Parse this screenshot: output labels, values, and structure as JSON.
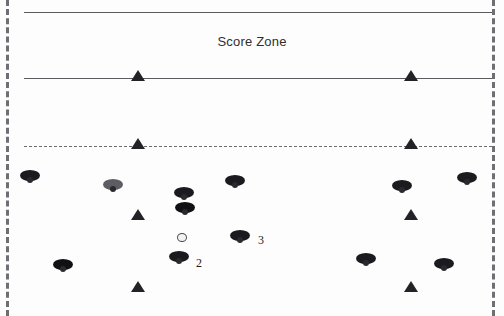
{
  "canvas": {
    "width": 504,
    "height": 316,
    "background": "#fdfdfd"
  },
  "colors": {
    "line": "#5a5a5f",
    "sideline": "#6f6f73",
    "cone": "#232327",
    "player_dark": "#1b1b1f",
    "player_light": "#5d5d63",
    "text": "#2e2e32"
  },
  "field": {
    "zone_label": "Score Zone",
    "sidelines": [
      {
        "name": "left-sideline",
        "x": 6,
        "style": "dashed"
      },
      {
        "name": "right-sideline",
        "x": 492,
        "style": "dashed"
      }
    ],
    "lines": [
      {
        "name": "end-line",
        "y": 12,
        "style": "solid"
      },
      {
        "name": "score-zone-line",
        "y": 78,
        "style": "solid"
      },
      {
        "name": "restraining-line",
        "y": 146,
        "style": "dashed"
      }
    ]
  },
  "cones": [
    {
      "id": "cone-1",
      "x": 131,
      "y": 70
    },
    {
      "id": "cone-2",
      "x": 404,
      "y": 70
    },
    {
      "id": "cone-3",
      "x": 131,
      "y": 138
    },
    {
      "id": "cone-4",
      "x": 404,
      "y": 138
    },
    {
      "id": "cone-5",
      "x": 131,
      "y": 209
    },
    {
      "id": "cone-6",
      "x": 404,
      "y": 209
    },
    {
      "id": "cone-7",
      "x": 131,
      "y": 281
    },
    {
      "id": "cone-8",
      "x": 404,
      "y": 281
    }
  ],
  "players": [
    {
      "id": "player-1",
      "x": 18,
      "y": 168,
      "shade": "dark"
    },
    {
      "id": "player-2",
      "x": 101,
      "y": 177,
      "shade": "light"
    },
    {
      "id": "player-3",
      "x": 172,
      "y": 185,
      "shade": "dark"
    },
    {
      "id": "player-4",
      "x": 173,
      "y": 200,
      "shade": "dark2"
    },
    {
      "id": "player-5",
      "x": 223,
      "y": 173,
      "shade": "dark"
    },
    {
      "id": "player-6",
      "x": 390,
      "y": 178,
      "shade": "dark"
    },
    {
      "id": "player-7",
      "x": 455,
      "y": 170,
      "shade": "dark"
    },
    {
      "id": "player-8",
      "x": 228,
      "y": 228,
      "shade": "dark"
    },
    {
      "id": "player-9",
      "x": 167,
      "y": 249,
      "shade": "dark"
    },
    {
      "id": "player-10",
      "x": 51,
      "y": 257,
      "shade": "dark2"
    },
    {
      "id": "player-11",
      "x": 354,
      "y": 251,
      "shade": "dark"
    },
    {
      "id": "player-12",
      "x": 432,
      "y": 256,
      "shade": "dark"
    }
  ],
  "ball": {
    "id": "ball",
    "x": 177,
    "y": 233
  },
  "annotations": [
    {
      "id": "label-2",
      "text": "2",
      "x": 196,
      "y": 256
    },
    {
      "id": "label-3",
      "text": "3",
      "x": 258,
      "y": 233
    }
  ]
}
